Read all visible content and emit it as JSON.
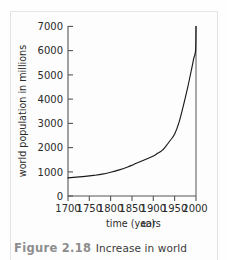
{
  "figure": {
    "caption_number": "Figure 2.18",
    "caption_text": "Increase in world"
  },
  "colors": {
    "curve": "#1a1a1a",
    "axis": "#555555",
    "text": "#2b2b2b",
    "caption_number": "#8d8d8d",
    "caption_text": "#3a3a3a",
    "background": "#fdfdfd",
    "frame": "#e2e2e2"
  },
  "chart_data": {
    "type": "line",
    "title": "",
    "xlabel_main": "time (years",
    "xlabel_unit": "AD",
    "xlabel_close": ")",
    "xlabel": "time (years AD)",
    "ylabel": "world population in millions",
    "xlim": [
      1700,
      2000
    ],
    "ylim": [
      0,
      7000
    ],
    "grid": false,
    "legend": "none",
    "xticks": [
      1700,
      1750,
      1800,
      1850,
      1900,
      1950,
      2000
    ],
    "xtick_labels": [
      "1700",
      "1750",
      "1800",
      "1850",
      "1900",
      "1950",
      "2000"
    ],
    "yticks": [
      0,
      1000,
      2000,
      3000,
      4000,
      5000,
      6000,
      7000
    ],
    "ytick_labels": [
      "0",
      "1000",
      "2000",
      "3000",
      "4000",
      "5000",
      "6000",
      "7000"
    ],
    "series": [
      {
        "name": "world population",
        "x": [
          1700,
          1720,
          1740,
          1760,
          1780,
          1800,
          1820,
          1840,
          1850,
          1860,
          1880,
          1900,
          1910,
          1920,
          1930,
          1940,
          1950,
          1960,
          1970,
          1980,
          1990,
          1995,
          1999,
          2000
        ],
        "values": [
          750,
          780,
          810,
          850,
          900,
          980,
          1080,
          1200,
          1270,
          1350,
          1500,
          1650,
          1760,
          1870,
          2070,
          2300,
          2560,
          3030,
          3700,
          4440,
          5270,
          5700,
          6000,
          7000
        ]
      }
    ]
  }
}
